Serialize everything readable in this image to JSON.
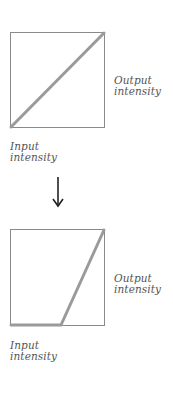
{
  "diagram": {
    "colors": {
      "box_border": "#8a8a8a",
      "curve": "#9a9a9a",
      "text": "#555555",
      "arrow": "#222222"
    },
    "top_panel": {
      "description": "Identity mapping: output equals input",
      "curve_points": [
        [
          0,
          0
        ],
        [
          1,
          1
        ]
      ],
      "output_label_line1": "Output",
      "output_label_line2": "intensity",
      "input_label_line1": "Input",
      "input_label_line2": "intensity"
    },
    "arrow": {
      "direction": "down"
    },
    "bottom_panel": {
      "description": "Threshold mapping: output zero until ~53% input, then linear ramp to max",
      "curve_points": [
        [
          0,
          0
        ],
        [
          0.53,
          0
        ],
        [
          1,
          1
        ]
      ],
      "output_label_line1": "Output",
      "output_label_line2": "intensity",
      "input_label_line1": "Input",
      "input_label_line2": "intensity"
    }
  }
}
